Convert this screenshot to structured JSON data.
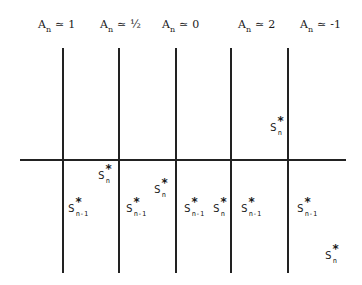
{
  "figure": {
    "columns": [
      {
        "symbol": "A",
        "subscript": "n",
        "relation": "≃",
        "value": "1"
      },
      {
        "symbol": "A",
        "subscript": "n",
        "relation": "≃",
        "value": "½"
      },
      {
        "symbol": "A",
        "subscript": "n",
        "relation": "≃",
        "value": "0"
      },
      {
        "symbol": "A",
        "subscript": "n",
        "relation": "≃",
        "value": "2"
      },
      {
        "symbol": "A",
        "subscript": "n",
        "relation": "≃",
        "value": "-1"
      }
    ],
    "points": [
      {
        "base": "S",
        "sup": "*",
        "sub": "n"
      },
      {
        "base": "S",
        "sup": "*",
        "sub": "n-1"
      },
      {
        "base": "S",
        "sup": "*",
        "sub": "n-1"
      },
      {
        "base": "S",
        "sup": "*",
        "sub": "n"
      },
      {
        "base": "S",
        "sup": "*",
        "sub": "n-1"
      },
      {
        "base": "S",
        "sup": "*",
        "sub": "n"
      },
      {
        "base": "S",
        "sup": "*",
        "sub": "n"
      },
      {
        "base": "S",
        "sup": "*",
        "sub": "n-1"
      },
      {
        "base": "S",
        "sup": "*",
        "sub": "n-1"
      },
      {
        "base": "S",
        "sup": "*",
        "sub": "n"
      }
    ]
  }
}
